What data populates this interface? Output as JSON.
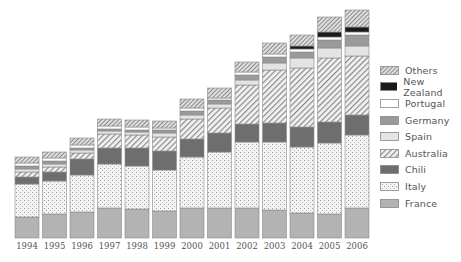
{
  "chart_data": {
    "type": "bar",
    "stacked": true,
    "title": "",
    "xlabel": "",
    "ylabel": "",
    "grid": false,
    "legend_position": "right",
    "categories": [
      "1994",
      "1995",
      "1996",
      "1997",
      "1998",
      "1999",
      "2000",
      "2001",
      "2002",
      "2003",
      "2004",
      "2005",
      "2006"
    ],
    "series": [
      {
        "name": "France",
        "pattern": "solid-lightgray",
        "values": [
          21,
          24,
          26,
          30,
          29,
          27,
          30,
          30,
          30,
          28,
          25,
          24,
          30
        ]
      },
      {
        "name": "Italy",
        "pattern": "dotted",
        "values": [
          33,
          33,
          37,
          44,
          43,
          41,
          51,
          56,
          66,
          68,
          66,
          71,
          73
        ]
      },
      {
        "name": "Chili",
        "pattern": "solid-darkgray",
        "values": [
          7,
          9,
          16,
          16,
          18,
          19,
          18,
          19,
          18,
          19,
          20,
          21,
          20
        ]
      },
      {
        "name": "Australia",
        "pattern": "diagonal-hatch",
        "values": [
          5,
          5,
          6,
          14,
          13,
          14,
          20,
          25,
          39,
          53,
          59,
          64,
          59
        ]
      },
      {
        "name": "Spain",
        "pattern": "solid-verylight",
        "values": [
          3,
          3,
          3,
          3,
          3,
          4,
          4,
          4,
          5,
          7,
          10,
          10,
          10
        ]
      },
      {
        "name": "Germany",
        "pattern": "solid-midgray",
        "values": [
          3,
          3,
          2,
          2,
          2,
          3,
          4,
          4,
          5,
          6,
          6,
          8,
          11
        ]
      },
      {
        "name": "Portugal",
        "pattern": "white",
        "values": [
          3,
          3,
          3,
          3,
          3,
          2,
          3,
          2,
          3,
          3,
          3,
          3,
          3
        ]
      },
      {
        "name": "New Zealand",
        "pattern": "solid-black",
        "values": [
          0,
          0,
          0,
          0,
          0,
          0,
          0,
          0,
          0,
          0,
          3,
          5,
          5
        ]
      },
      {
        "name": "Others",
        "pattern": "crosshatch",
        "values": [
          6,
          6,
          7,
          7,
          7,
          7,
          9,
          10,
          10,
          11,
          11,
          15,
          17
        ]
      }
    ],
    "legend": [
      "Others",
      "New Zealand",
      "Portugal",
      "Germany",
      "Spain",
      "Australia",
      "Chili",
      "Italy",
      "France"
    ]
  },
  "colors": {
    "France": "#b3b3b3",
    "Italy": "#f2f2f2",
    "Chili": "#6e6e6e",
    "Australia": "#ececec",
    "Spain": "#e4e4e4",
    "Germany": "#9a9a9a",
    "Portugal": "#ffffff",
    "New Zealand": "#1a1a1a",
    "Others": "#d6d6d6"
  }
}
